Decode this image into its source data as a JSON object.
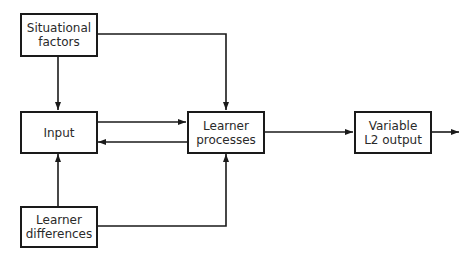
{
  "diagram": {
    "nodes": [
      {
        "id": "situational",
        "label": "Situational\nfactors"
      },
      {
        "id": "input",
        "label": "Input"
      },
      {
        "id": "differences",
        "label": "Learner\ndifferences"
      },
      {
        "id": "processes",
        "label": "Learner\nprocesses"
      },
      {
        "id": "output",
        "label": "Variable\nL2 output"
      }
    ],
    "edges": [
      {
        "from": "situational",
        "to": "input"
      },
      {
        "from": "situational",
        "to": "processes"
      },
      {
        "from": "input",
        "to": "processes"
      },
      {
        "from": "processes",
        "to": "input"
      },
      {
        "from": "differences",
        "to": "input"
      },
      {
        "from": "differences",
        "to": "processes"
      },
      {
        "from": "processes",
        "to": "output"
      },
      {
        "from": "output",
        "to": "external"
      }
    ],
    "colors": {
      "stroke": "#1a1a1a",
      "background": "#ffffff"
    }
  }
}
